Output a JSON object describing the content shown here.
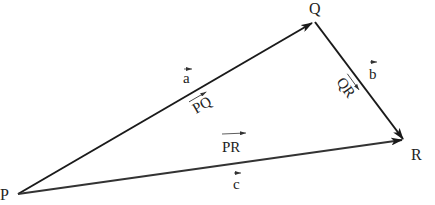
{
  "diagram": {
    "type": "vector-triangle",
    "points": {
      "P": {
        "label": "P",
        "x": 18,
        "y": 194
      },
      "Q": {
        "label": "Q",
        "x": 314,
        "y": 22
      },
      "R": {
        "label": "R",
        "x": 404,
        "y": 140
      }
    },
    "vectors": [
      {
        "from": "P",
        "to": "Q",
        "name": "PQ",
        "symbol": "a"
      },
      {
        "from": "Q",
        "to": "R",
        "name": "QR",
        "symbol": "b"
      },
      {
        "from": "P",
        "to": "R",
        "name": "PR",
        "symbol": "c"
      }
    ],
    "labels": {
      "point_p": "P",
      "point_q": "Q",
      "point_r": "R",
      "vec_a": "a",
      "vec_b": "b",
      "vec_c": "c",
      "seg_pq": "PQ",
      "seg_qr": "QR",
      "seg_pr": "PR"
    },
    "colors": {
      "line": "#1a1a1a",
      "pr_line": "#333333",
      "text": "#222222"
    }
  }
}
